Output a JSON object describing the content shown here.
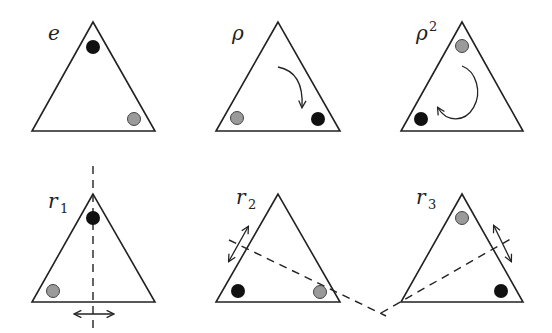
{
  "colors": {
    "black_dot": "#111111",
    "gray_dot": "#9a9a9a",
    "line": "#222222"
  },
  "panels": [
    {
      "id": "e",
      "label": "e",
      "sub": "",
      "sup": "",
      "annotation": "identity"
    },
    {
      "id": "rho",
      "label": "ρ",
      "sub": "",
      "sup": "",
      "annotation": "clockwise-rotation-arrow"
    },
    {
      "id": "rho2",
      "label": "ρ",
      "sub": "",
      "sup": "2",
      "annotation": "circular-rotation-arrow"
    },
    {
      "id": "r1",
      "label": "r",
      "sub": "1",
      "sup": "",
      "annotation": "vertical-reflection-axis"
    },
    {
      "id": "r2",
      "label": "r",
      "sub": "2",
      "sup": "",
      "annotation": "reflection-axis-through-bottom-right"
    },
    {
      "id": "r3",
      "label": "r",
      "sub": "3",
      "sup": "",
      "annotation": "reflection-axis-through-bottom-left"
    }
  ]
}
